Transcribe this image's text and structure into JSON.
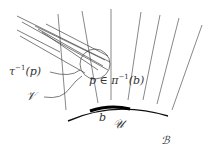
{
  "diagram": {
    "type": "fiber-bundle-sketch",
    "labels": {
      "tau_inverse": "τ⁻¹(p)",
      "tau_base": "τ",
      "tau_sup": "−1",
      "tau_arg": "(p)",
      "V": "𝒱",
      "p_in_fiber_pre": "p ∈ π",
      "p_sup": "−1",
      "p_arg": "(b)",
      "b": "b",
      "U": "𝒰",
      "B": "ℬ"
    },
    "colors": {
      "line": "#555555",
      "base_curve": "#111111",
      "highlight": "#000000",
      "text": "#333333"
    },
    "fibers": [
      {
        "x1": 58,
        "y1": 14,
        "x2": 66,
        "y2": 110
      },
      {
        "x1": 82,
        "y1": 11,
        "x2": 98,
        "y2": 103
      },
      {
        "x1": 111,
        "y1": 9,
        "x2": 111,
        "y2": 100
      },
      {
        "x1": 141,
        "y1": 12,
        "x2": 128,
        "y2": 100
      },
      {
        "x1": 160,
        "y1": 15,
        "x2": 143,
        "y2": 100
      },
      {
        "x1": 179,
        "y1": 18,
        "x2": 157,
        "y2": 104
      },
      {
        "x1": 202,
        "y1": 25,
        "x2": 172,
        "y2": 110
      }
    ],
    "leaves": [
      {
        "x1": 17,
        "y1": 16,
        "x2": 110,
        "y2": 62
      },
      {
        "x1": 22,
        "y1": 22,
        "x2": 108,
        "y2": 70
      },
      {
        "x1": 35,
        "y1": 26,
        "x2": 105,
        "y2": 60
      },
      {
        "x1": 38,
        "y1": 29,
        "x2": 103,
        "y2": 66
      },
      {
        "x1": 42,
        "y1": 32,
        "x2": 98,
        "y2": 70
      },
      {
        "x1": 20,
        "y1": 36,
        "x2": 85,
        "y2": 73
      },
      {
        "x1": 46,
        "y1": 24,
        "x2": 108,
        "y2": 56
      },
      {
        "x1": 17,
        "y1": 30,
        "x2": 60,
        "y2": 52
      }
    ]
  }
}
